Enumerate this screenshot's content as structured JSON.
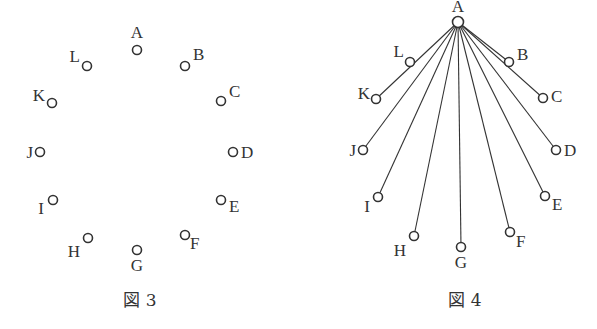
{
  "figures": [
    {
      "caption": "図 3",
      "nodes": [
        {
          "id": "A",
          "x": 137,
          "y": 50,
          "lx": 137,
          "ly": 38,
          "anchor": "middle"
        },
        {
          "id": "B",
          "x": 185,
          "y": 66,
          "lx": 193,
          "ly": 60,
          "anchor": "start"
        },
        {
          "id": "C",
          "x": 221,
          "y": 101,
          "lx": 229,
          "ly": 97,
          "anchor": "start"
        },
        {
          "id": "D",
          "x": 233,
          "y": 152,
          "lx": 241,
          "ly": 158,
          "anchor": "start"
        },
        {
          "id": "E",
          "x": 221,
          "y": 200,
          "lx": 229,
          "ly": 212,
          "anchor": "start"
        },
        {
          "id": "F",
          "x": 185,
          "y": 235,
          "lx": 190,
          "ly": 249,
          "anchor": "start"
        },
        {
          "id": "G",
          "x": 137,
          "y": 250,
          "lx": 137,
          "ly": 271,
          "anchor": "middle"
        },
        {
          "id": "H",
          "x": 88,
          "y": 238,
          "lx": 80,
          "ly": 257,
          "anchor": "end"
        },
        {
          "id": "I",
          "x": 53,
          "y": 200,
          "lx": 44,
          "ly": 214,
          "anchor": "end"
        },
        {
          "id": "J",
          "x": 40,
          "y": 152,
          "lx": 33,
          "ly": 158,
          "anchor": "end"
        },
        {
          "id": "K",
          "x": 52,
          "y": 103,
          "lx": 45,
          "ly": 101,
          "anchor": "end"
        },
        {
          "id": "L",
          "x": 87,
          "y": 66,
          "lx": 80,
          "ly": 62,
          "anchor": "end"
        }
      ],
      "caption_pos": {
        "x": 140,
        "y": 306
      },
      "edges": []
    },
    {
      "caption": "図 4",
      "nodes": [
        {
          "id": "A",
          "x": 458,
          "y": 22,
          "lx": 458,
          "ly": 12,
          "anchor": "middle"
        },
        {
          "id": "B",
          "x": 509,
          "y": 62,
          "lx": 517,
          "ly": 60,
          "anchor": "start"
        },
        {
          "id": "C",
          "x": 543,
          "y": 98,
          "lx": 551,
          "ly": 102,
          "anchor": "start"
        },
        {
          "id": "D",
          "x": 556,
          "y": 150,
          "lx": 564,
          "ly": 156,
          "anchor": "start"
        },
        {
          "id": "E",
          "x": 545,
          "y": 196,
          "lx": 552,
          "ly": 210,
          "anchor": "start"
        },
        {
          "id": "F",
          "x": 510,
          "y": 232,
          "lx": 516,
          "ly": 247,
          "anchor": "start"
        },
        {
          "id": "G",
          "x": 461,
          "y": 247,
          "lx": 461,
          "ly": 268,
          "anchor": "middle"
        },
        {
          "id": "H",
          "x": 414,
          "y": 236,
          "lx": 406,
          "ly": 256,
          "anchor": "end"
        },
        {
          "id": "I",
          "x": 378,
          "y": 197,
          "lx": 370,
          "ly": 212,
          "anchor": "end"
        },
        {
          "id": "J",
          "x": 363,
          "y": 150,
          "lx": 356,
          "ly": 156,
          "anchor": "end"
        },
        {
          "id": "K",
          "x": 376,
          "y": 99,
          "lx": 370,
          "ly": 99,
          "anchor": "end"
        },
        {
          "id": "L",
          "x": 410,
          "y": 62,
          "lx": 404,
          "ly": 57,
          "anchor": "end"
        }
      ],
      "caption_pos": {
        "x": 465,
        "y": 306
      },
      "edges": [
        [
          "A",
          "B"
        ],
        [
          "A",
          "C"
        ],
        [
          "A",
          "D"
        ],
        [
          "A",
          "E"
        ],
        [
          "A",
          "F"
        ],
        [
          "A",
          "G"
        ],
        [
          "A",
          "H"
        ],
        [
          "A",
          "I"
        ],
        [
          "A",
          "J"
        ],
        [
          "A",
          "K"
        ]
      ]
    }
  ]
}
